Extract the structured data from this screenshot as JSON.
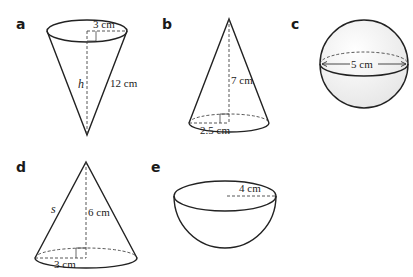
{
  "figures": [
    {
      "id": "a",
      "label": "a",
      "shape": "inverted cone",
      "radius": "3 cm",
      "slant": "12 cm",
      "height": "h"
    },
    {
      "id": "b",
      "label": "b",
      "shape": "cone",
      "radius": "2.5 cm",
      "height": "7 cm"
    },
    {
      "id": "c",
      "label": "c",
      "shape": "sphere",
      "diameter": "5 cm"
    },
    {
      "id": "d",
      "label": "d",
      "shape": "cone",
      "radius": "3 cm",
      "height": "6 cm",
      "slant": "s"
    },
    {
      "id": "e",
      "label": "e",
      "shape": "hemisphere",
      "radius": "4 cm"
    }
  ],
  "colors": {
    "stroke": "#222222",
    "sphere_fill": "#f2f2f2",
    "background": "#ffffff"
  }
}
